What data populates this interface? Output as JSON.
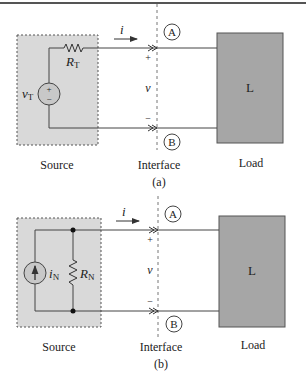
{
  "figure_a": {
    "source_label": "Source",
    "interface_label": "Interface",
    "load_label": "Load",
    "caption": "(a)",
    "current_label": "i",
    "voltage_label": "v",
    "plus": "+",
    "minus": "−",
    "terminal_top": "A",
    "terminal_bottom": "B",
    "source_voltage": "v",
    "source_voltage_sub": "T",
    "resistor": "R",
    "resistor_sub": "T",
    "load_box": "L",
    "source_plus": "+",
    "source_minus": "−"
  },
  "figure_b": {
    "source_label": "Source",
    "interface_label": "Interface",
    "load_label": "Load",
    "caption": "(b)",
    "current_label": "i",
    "voltage_label": "v",
    "plus": "+",
    "minus": "−",
    "terminal_top": "A",
    "terminal_bottom": "B",
    "source_current": "i",
    "source_current_sub": "N",
    "resistor": "R",
    "resistor_sub": "N",
    "load_box": "L"
  },
  "colors": {
    "source_fill": "#d9d9d9",
    "load_fill": "#a6a6a6",
    "source_circle_fill": "#c8c8c8",
    "wire": "#444444"
  }
}
